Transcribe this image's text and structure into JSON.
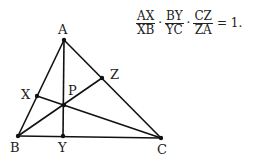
{
  "diagram": {
    "type": "geometry",
    "points": {
      "A": {
        "x": 64,
        "y": 40,
        "label": "A",
        "lx": 58,
        "ly": 34
      },
      "B": {
        "x": 18,
        "y": 136,
        "label": "B",
        "lx": 10,
        "ly": 152
      },
      "C": {
        "x": 161,
        "y": 138,
        "label": "C",
        "lx": 157,
        "ly": 154
      },
      "X": {
        "x": 37,
        "y": 96,
        "label": "X",
        "lx": 21,
        "ly": 99
      },
      "Y": {
        "x": 63,
        "y": 136,
        "label": "Y",
        "lx": 58,
        "ly": 152
      },
      "Z": {
        "x": 102,
        "y": 78,
        "label": "Z",
        "lx": 110,
        "ly": 79
      },
      "P": {
        "x": 64,
        "y": 105,
        "label": "P",
        "lx": 68,
        "ly": 95
      }
    },
    "segments": [
      [
        "A",
        "B"
      ],
      [
        "B",
        "C"
      ],
      [
        "C",
        "A"
      ],
      [
        "A",
        "Y"
      ],
      [
        "B",
        "Z"
      ],
      [
        "C",
        "X"
      ]
    ],
    "colors": {
      "line": "#111111",
      "text": "#222222",
      "background": "#ffffff"
    }
  },
  "formula": {
    "terms": [
      {
        "num": "AX",
        "den": "XB"
      },
      {
        "num": "BY",
        "den": "YC"
      },
      {
        "num": "CZ",
        "den": "ZA"
      }
    ],
    "operator": "·",
    "rhs": "= 1."
  }
}
